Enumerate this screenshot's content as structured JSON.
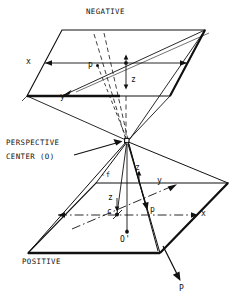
{
  "figure": {
    "type": "technical-line-diagram",
    "background_color": "#ffffff",
    "line_color": "#111111"
  },
  "labels": {
    "negative_plane": "NEGATIVE",
    "positive_plane": "POSITIVE",
    "perspective_center_line1": "PERSPECTIVE",
    "perspective_center_line2": "CENTER (O)",
    "upper_x_axis": "x",
    "upper_y_axis": "y",
    "upper_z_axis": "z",
    "upper_point": "p",
    "lower_x_axis": "x",
    "lower_y_axis": "y",
    "lower_z_axis": "z",
    "lower_z_vertical": "z",
    "focal_length": "-f",
    "principal_point": "c",
    "image_point": "p",
    "ground_origin": "O'",
    "object_point": "P"
  },
  "geometry": {
    "upper_plane_vertices": "parallelogram",
    "lower_plane_vertices": "parallelogram",
    "apex": "perspective center O",
    "ray_count": 8
  }
}
